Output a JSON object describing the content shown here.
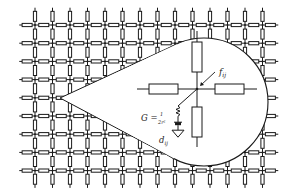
{
  "diagram": {
    "grid": {
      "cols_x": [
        35,
        52.5,
        70,
        87.5,
        105,
        122.5,
        140,
        157.5,
        175,
        192.5,
        210,
        227.5,
        245,
        262.5
      ],
      "rows_y": [
        25,
        43.2,
        61.4,
        79.6,
        97.8,
        116,
        134.2,
        152.4,
        170.6
      ],
      "stroke_color": "#1a1a1a"
    },
    "magnifier": {
      "cx": 204,
      "cy": 102,
      "r": 64,
      "pointer_tip": {
        "x": 60,
        "y": 98
      },
      "node": {
        "x": 197,
        "y": 89
      }
    },
    "labels": {
      "current": "f",
      "current_sub": "ij",
      "conductance": "G =",
      "conductance_num": "1",
      "conductance_den": "2r²",
      "source": "d",
      "source_sub": "ij"
    }
  }
}
